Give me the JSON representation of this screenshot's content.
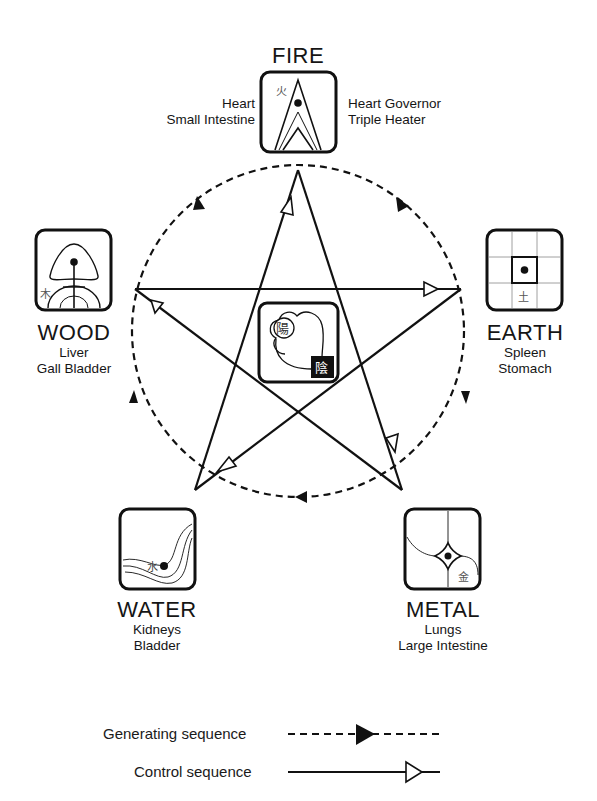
{
  "elements": {
    "fire": {
      "name": "FIRE",
      "organs_left": [
        "Heart",
        "Small Intestine"
      ],
      "organs_right": [
        "Heart Governor",
        "Triple Heater"
      ],
      "glyph": "火",
      "icon": "fire-flame-icon"
    },
    "earth": {
      "name": "EARTH",
      "organs": [
        "Spleen",
        "Stomach"
      ],
      "glyph": "土",
      "icon": "earth-grid-icon"
    },
    "metal": {
      "name": "METAL",
      "organs": [
        "Lungs",
        "Large Intestine"
      ],
      "glyph": "金",
      "icon": "metal-diamond-icon"
    },
    "water": {
      "name": "WATER",
      "organs": [
        "Kidneys",
        "Bladder"
      ],
      "glyph": "水",
      "icon": "water-wave-icon"
    },
    "wood": {
      "name": "WOOD",
      "organs": [
        "Liver",
        "Gall Bladder"
      ],
      "glyph": "木",
      "icon": "wood-tree-icon"
    }
  },
  "center": {
    "yang_glyph": "陽",
    "yin_glyph": "陰",
    "icon": "yin-yang-icon"
  },
  "legend": {
    "generating_label": "Generating sequence",
    "control_label": "Control sequence"
  },
  "colors": {
    "stroke": "#111111",
    "background": "#ffffff"
  }
}
